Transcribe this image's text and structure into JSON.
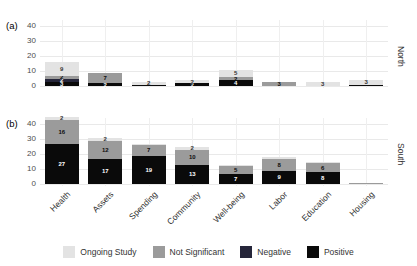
{
  "chart_data": {
    "type": "bar",
    "stacked": true,
    "orientation": "vertical",
    "grid": true,
    "categories": [
      "Health",
      "Assets",
      "Spending",
      "Community",
      "Well-being",
      "Labor",
      "Education",
      "Housing"
    ],
    "yticks": [
      0,
      10,
      20,
      30,
      40
    ],
    "ylim": [
      0,
      47
    ],
    "series_stack_order_bottom_to_top": [
      "Positive",
      "Negative",
      "Not Significant",
      "Ongoing Study"
    ],
    "panels": [
      {
        "letter": "(a)",
        "strip": "North",
        "series": [
          {
            "name": "Positive",
            "values": [
              3,
              2,
              1,
              2,
              4,
              0,
              0,
              1
            ]
          },
          {
            "name": "Negative",
            "values": [
              2,
              0,
              0,
              0,
              0,
              0,
              0,
              0
            ]
          },
          {
            "name": "Not Significant",
            "values": [
              2,
              7,
              0,
              0,
              2,
              3,
              0,
              0
            ]
          },
          {
            "name": "Ongoing Study",
            "values": [
              9,
              0,
              2,
              2,
              5,
              0,
              3,
              3
            ]
          }
        ]
      },
      {
        "letter": "(b)",
        "strip": "South",
        "series": [
          {
            "name": "Positive",
            "values": [
              27,
              17,
              19,
              13,
              7,
              9,
              8,
              0
            ]
          },
          {
            "name": "Negative",
            "values": [
              0,
              0,
              0,
              0,
              0,
              0,
              0,
              0
            ]
          },
          {
            "name": "Not Significant",
            "values": [
              16,
              12,
              7,
              10,
              5,
              8,
              6,
              1
            ]
          },
          {
            "name": "Ongoing Study",
            "values": [
              2,
              2,
              1,
              2,
              1,
              1,
              1,
              0
            ]
          }
        ]
      }
    ],
    "legend": [
      "Ongoing Study",
      "Not Significant",
      "Negative",
      "Positive"
    ],
    "colors": {
      "Ongoing Study": "#e3e3e3",
      "Not Significant": "#9b9b9b",
      "Negative": "#26263a",
      "Positive": "#0a0a0a"
    },
    "label_colors": {
      "Ongoing Study": "#333333",
      "Not Significant": "#0d0d0d",
      "Negative": "#ffffff",
      "Positive": "#ffffff"
    },
    "title": "",
    "xlabel": "",
    "ylabel": ""
  }
}
